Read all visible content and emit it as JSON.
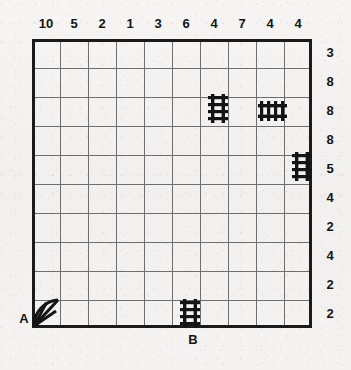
{
  "puzzle": {
    "title": "",
    "grid": {
      "columns": 10,
      "rows": 10
    },
    "colors": {
      "ink": "#141414",
      "frame": "#1b1b1b",
      "gridline": "#6f6f6f",
      "paper": "#f3f2f0"
    },
    "column_clues": [
      "10",
      "5",
      "2",
      "1",
      "3",
      "6",
      "4",
      "7",
      "4",
      "4"
    ],
    "row_clues": [
      "3",
      "8",
      "8",
      "8",
      "5",
      "4",
      "2",
      "4",
      "2",
      "2"
    ],
    "edge_labels": [
      {
        "name": "start-label-a",
        "text": "A",
        "side": "left",
        "row": 10
      },
      {
        "name": "end-label-b",
        "text": "B",
        "side": "bottom",
        "column": 6
      }
    ],
    "pieces": [
      {
        "name": "track-vertical-c7r3",
        "kind": "track-vertical",
        "column": 7,
        "row": 3
      },
      {
        "name": "track-horizontal-c9r3",
        "kind": "track-horizontal",
        "column": 9,
        "row": 3
      },
      {
        "name": "track-vertical-c10r5",
        "kind": "track-vertical",
        "column": 10,
        "row": 5
      },
      {
        "name": "fan-marker-c1r10",
        "kind": "fan",
        "column": 1,
        "row": 10
      },
      {
        "name": "track-vertical-c6r10",
        "kind": "track-vertical",
        "column": 6,
        "row": 10
      }
    ]
  }
}
